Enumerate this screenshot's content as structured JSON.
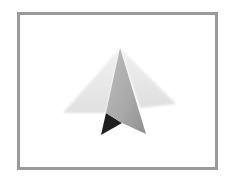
{
  "image": {
    "subject": "Framed artwork of a folded paper pyramid shape",
    "frame_color": "#9a9a9a",
    "background_color": "#ffffff",
    "colors": {
      "back_face": "#e4e4e4",
      "front_face": "#a9a9a9",
      "shadow_face": "#1e1e1e"
    }
  },
  "caption": {
    "text": "····"
  }
}
